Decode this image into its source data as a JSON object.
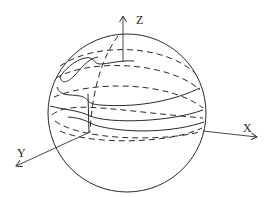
{
  "figure": {
    "type": "sphere-with-wavy-latitude-curves",
    "axes": {
      "x_label": "X",
      "y_label": "Y",
      "z_label": "Z"
    },
    "colors": {
      "stroke": "#2a2a2a",
      "background": "#ffffff"
    }
  }
}
